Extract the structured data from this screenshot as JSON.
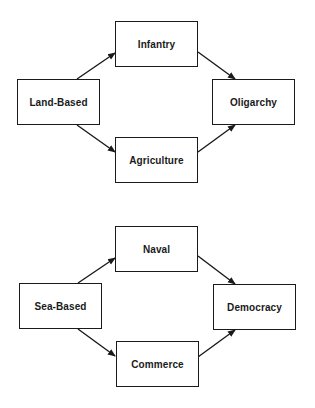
{
  "diagrams": [
    {
      "name": "land-based",
      "nodes": {
        "source": {
          "label": "Land-Based"
        },
        "upper": {
          "label": "Infantry"
        },
        "lower": {
          "label": "Agriculture"
        },
        "target": {
          "label": "Oligarchy"
        }
      },
      "edges": [
        {
          "from": "Land-Based",
          "to": "Infantry"
        },
        {
          "from": "Land-Based",
          "to": "Agriculture"
        },
        {
          "from": "Infantry",
          "to": "Oligarchy"
        },
        {
          "from": "Agriculture",
          "to": "Oligarchy"
        }
      ]
    },
    {
      "name": "sea-based",
      "nodes": {
        "source": {
          "label": "Sea-Based"
        },
        "upper": {
          "label": "Naval"
        },
        "lower": {
          "label": "Commerce"
        },
        "target": {
          "label": "Democracy"
        }
      },
      "edges": [
        {
          "from": "Sea-Based",
          "to": "Naval"
        },
        {
          "from": "Sea-Based",
          "to": "Commerce"
        },
        {
          "from": "Naval",
          "to": "Democracy"
        },
        {
          "from": "Commerce",
          "to": "Democracy"
        }
      ]
    }
  ],
  "colors": {
    "stroke": "#1a1a1a",
    "background": "#ffffff"
  }
}
